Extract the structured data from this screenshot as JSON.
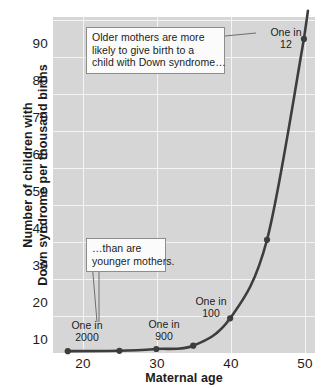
{
  "chart_data": {
    "type": "line",
    "title": "",
    "xlabel": "Maternal age",
    "ylabel": "Number of children with Down syndrome per thousand births",
    "ylabel_lines": [
      "Number of children with",
      "Down syndrome per thousand births"
    ],
    "x": [
      18,
      25,
      30,
      35,
      40,
      45,
      50
    ],
    "values": [
      0.5,
      0.6,
      1.1,
      2.0,
      9.5,
      31.0,
      86.0
    ],
    "series": [
      {
        "name": "Down syndrome births per thousand",
        "x": [
          18,
          25,
          30,
          35,
          40,
          45,
          50
        ],
        "values": [
          0.5,
          0.6,
          1.1,
          2.0,
          9.5,
          31.0,
          86.0
        ]
      }
    ],
    "xlim": [
      16,
      51.5
    ],
    "ylim": [
      0,
      92
    ],
    "xticks": [
      20,
      30,
      40,
      50
    ],
    "yticks": [
      10,
      20,
      30,
      40,
      50,
      60,
      70,
      80,
      90
    ],
    "xtick_labels": [
      "20",
      "30",
      "40",
      "50"
    ],
    "ytick_labels": [
      "10",
      "20",
      "30",
      "40",
      "50",
      "60",
      "70",
      "80",
      "90"
    ],
    "grid": true,
    "grid_color": "#f4f4f4",
    "panel_color": "#d6d6d6",
    "line_color": "#3d3d3d",
    "marker_color": "#3d3d3d",
    "legend": null,
    "legend_position": "none",
    "annotations": [
      {
        "name": "one-in-2000",
        "lines": [
          "One in",
          "2000"
        ],
        "text": "One in 2000",
        "at_x": 18,
        "at_y": 0.5
      },
      {
        "name": "one-in-900",
        "lines": [
          "One in",
          "900"
        ],
        "text": "One in 900",
        "at_x": 30,
        "at_y": 1.1
      },
      {
        "name": "one-in-100",
        "lines": [
          "One in",
          "100"
        ],
        "text": "One in 100",
        "at_x": 40,
        "at_y": 9.5
      },
      {
        "name": "one-in-12",
        "lines": [
          "One in",
          "12"
        ],
        "text": "One in 12",
        "at_x": 50,
        "at_y": 86.0
      }
    ],
    "callouts": [
      {
        "name": "older-mothers",
        "lines": [
          "Older mothers are more",
          "likely to give birth to a",
          "child with Down syndrome…"
        ],
        "text": "Older mothers are more likely to give birth to a child with Down syndrome…"
      },
      {
        "name": "younger-mothers",
        "lines": [
          "…than are",
          "younger mothers."
        ],
        "text": "…than are younger mothers."
      }
    ]
  }
}
